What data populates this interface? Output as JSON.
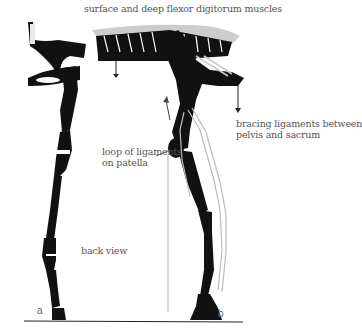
{
  "diagram": {
    "labels": {
      "top": "surface and deep flexor digitorum muscles",
      "bracing_line1": "bracing ligaments between",
      "bracing_line2": "pelvis and sacrum",
      "patella_line1": "loop of ligaments",
      "patella_line2": "on patella",
      "back_view": "back view",
      "panel_a": "a",
      "panel_b": "b"
    },
    "colors": {
      "bone": "#111111",
      "ligament": "#bbbbbb",
      "text": "#555555",
      "ground": "#222222"
    }
  }
}
